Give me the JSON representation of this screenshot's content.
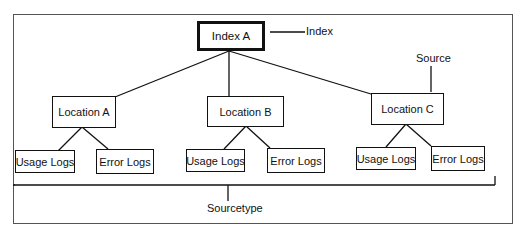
{
  "diagram": {
    "root": {
      "label": "Index A"
    },
    "annotations": {
      "index": "Index",
      "source": "Source",
      "sourcetype": "Sourcetype"
    },
    "locations": [
      {
        "label": "Location A",
        "children": [
          "Usage Logs",
          "Error Logs"
        ]
      },
      {
        "label": "Location B",
        "children": [
          "Usage Logs",
          "Error Logs"
        ]
      },
      {
        "label": "Location C",
        "children": [
          "Usage Logs",
          "Error Logs"
        ]
      }
    ]
  },
  "colors": {
    "line": "#111111",
    "frame": "#555555",
    "background": "#ffffff"
  }
}
